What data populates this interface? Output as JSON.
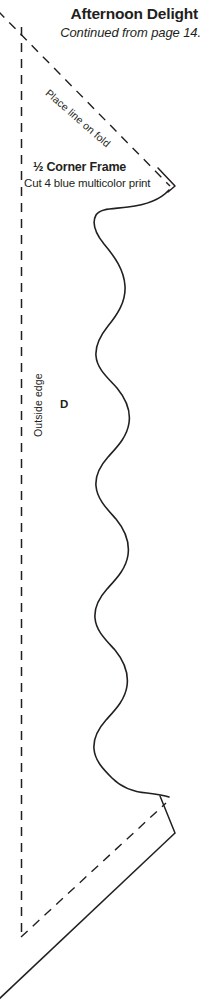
{
  "page": {
    "width": 204,
    "height": 1003,
    "background_color": "#ffffff",
    "ink_color": "#231f20"
  },
  "header": {
    "title": "Afternoon Delight",
    "subtitle": "Continued from page 14."
  },
  "pattern": {
    "piece_name": "Corner Frame",
    "piece_fraction": "½",
    "piece_name_full": "½ Corner Frame",
    "cut_instruction": "Cut 4 blue multicolor print",
    "fold_label": "Place line on fold",
    "outside_edge_label": "Outside edge",
    "piece_letter": "D"
  },
  "lines": {
    "fold_line_style": "dashed",
    "outside_edge_style": "dashed",
    "seam_line_style": "dashed",
    "cut_line_style": "solid",
    "stroke_color": "#231f20"
  }
}
